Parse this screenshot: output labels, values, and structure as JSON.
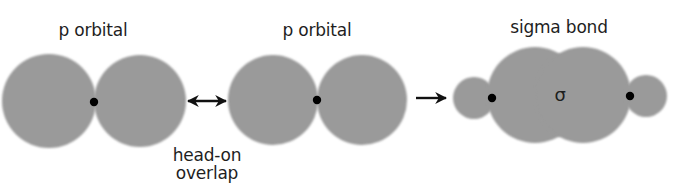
{
  "diagram": {
    "colors": {
      "lobe": "#9a9a9a",
      "nucleus": "#000000",
      "arrow": "#111111",
      "text": "#1e1e1e"
    },
    "labels": {
      "p_orbital_left": "p orbital",
      "p_orbital_middle": "p orbital",
      "sigma_bond": "sigma bond",
      "head_on": "head-on",
      "overlap": "overlap",
      "sigma_symbol": "σ"
    },
    "arrows": {
      "overlap_arrow": "double-headed",
      "result_arrow": "right"
    },
    "components": [
      {
        "name": "p orbital",
        "lobes": 2,
        "nuclei": 1
      },
      {
        "name": "p orbital",
        "lobes": 2,
        "nuclei": 1
      },
      {
        "name": "sigma bond",
        "lobes": 4,
        "nuclei": 2
      }
    ]
  }
}
